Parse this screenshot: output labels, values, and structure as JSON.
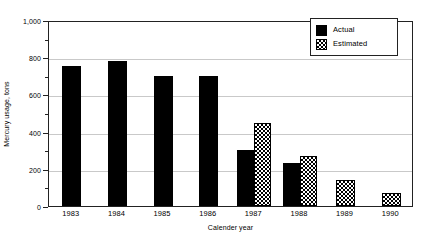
{
  "chart_data": {
    "type": "bar",
    "title": "",
    "xlabel": "Calender year",
    "ylabel": "Mercury usage, tons",
    "categories": [
      "1983",
      "1984",
      "1985",
      "1986",
      "1987",
      "1988",
      "1989",
      "1990"
    ],
    "series": [
      {
        "name": "Actual",
        "fill": "solid-black",
        "color": "#000000",
        "values": [
          755,
          780,
          700,
          700,
          300,
          230,
          null,
          null
        ]
      },
      {
        "name": "Estimated",
        "fill": "checkerboard",
        "color": "#000000",
        "values": [
          null,
          null,
          null,
          null,
          445,
          270,
          140,
          70
        ]
      }
    ],
    "ylim": [
      0,
      1000
    ],
    "ytick_values": [
      0,
      200,
      400,
      600,
      800,
      1000
    ],
    "ytick_labels": [
      "0",
      "200",
      "400",
      "600",
      "800",
      "1,000"
    ],
    "yminor_tick_values": [
      100,
      300,
      500,
      700,
      900
    ],
    "grid": "horizontal-major",
    "grid_color": "#c9c9c9",
    "legend_position": "top-right",
    "frame": "box"
  },
  "legend": {
    "entries": [
      {
        "label": "Actual",
        "swatch": "solid-black-swatch"
      },
      {
        "label": "Estimated",
        "swatch": "checkerboard-swatch"
      }
    ]
  }
}
